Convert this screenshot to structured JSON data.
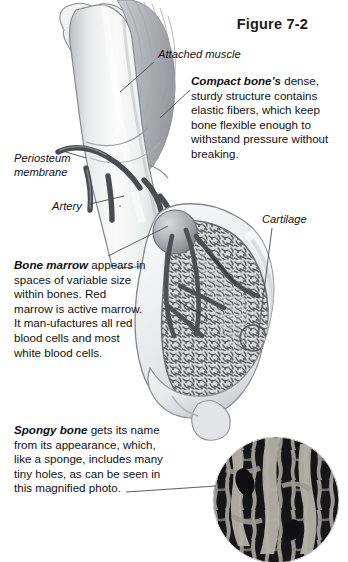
{
  "figure": {
    "title": "Figure 7-2",
    "background_color": "#ffffff",
    "ink_color": "#111111"
  },
  "labels": [
    {
      "id": "attached-muscle",
      "text": "Attached muscle"
    },
    {
      "id": "periosteum",
      "text": "Periosteum\nmembrane",
      "line1": "Periosteum",
      "line2": "membrane"
    },
    {
      "id": "artery",
      "text": "Artery"
    },
    {
      "id": "cartilage",
      "text": "Cartilage"
    }
  ],
  "callouts": [
    {
      "id": "compact-bone",
      "term": "Compact bone’s",
      "body": " dense, sturdy structure contains elastic fibers, which keep bone flexible enough to withstand pressure without breaking."
    },
    {
      "id": "bone-marrow",
      "term": "Bone marrow",
      "body": " appears in spaces of variable size within bones. Red marrow is active marrow. It man-ufactures all red blood cells and most white blood cells."
    },
    {
      "id": "spongy-bone",
      "term": "Spongy bone",
      "body": " gets its name from its appearance, which, like a sponge, includes many tiny holes, as can be seen in this magnified photo."
    }
  ],
  "art_elements": [
    {
      "name": "femur-shaft",
      "tone": "#e9e9ea"
    },
    {
      "name": "greater-trochanter",
      "tone": "#dededf"
    },
    {
      "name": "attached-muscle-fibers",
      "tone": "#c9cacc"
    },
    {
      "name": "periosteum-layer",
      "tone": "#d6d7d9"
    },
    {
      "name": "artery-network",
      "tone": "#4b4c50"
    },
    {
      "name": "cartilage-cap",
      "tone": "#ebecee"
    },
    {
      "name": "spongy-bone-trabeculae",
      "tone": "#6e6f73"
    },
    {
      "name": "bone-marrow-cavity",
      "tone": "#9a9b9f"
    },
    {
      "name": "magnified-photo-inset",
      "tone": "#1d1d1f"
    }
  ],
  "inset": {
    "name": "magnified-photo",
    "caption_reference": "magnified photo",
    "shape": "circle"
  }
}
